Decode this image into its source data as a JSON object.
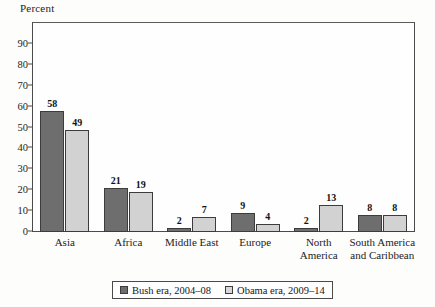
{
  "chart_data": {
    "type": "bar",
    "title": "",
    "ylabel": "Percent",
    "xlabel": "",
    "ylim": [
      0,
      100
    ],
    "yticks": [
      0,
      10,
      20,
      30,
      40,
      50,
      60,
      70,
      80,
      90
    ],
    "grid": false,
    "legend_position": "bottom",
    "categories": [
      "Asia",
      "Africa",
      "Middle East",
      "Europe",
      "North America",
      "South America and Caribbean"
    ],
    "category_lines": [
      [
        "Asia"
      ],
      [
        "Africa"
      ],
      [
        "Middle East"
      ],
      [
        "Europe"
      ],
      [
        "North",
        "America"
      ],
      [
        "South America",
        "and Caribbean"
      ]
    ],
    "series": [
      {
        "name": "Bush era, 2004–08",
        "color": "#6e6e6e",
        "values": [
          58,
          21,
          2,
          9,
          2,
          8
        ]
      },
      {
        "name": "Obama era, 2009–14",
        "color": "#d2d2d2",
        "values": [
          49,
          19,
          7,
          4,
          13,
          8
        ]
      }
    ]
  },
  "legend": {
    "entries": [
      {
        "label": "Bush era, 2004–08",
        "swatch": "bush"
      },
      {
        "label": "Obama era, 2009–14",
        "swatch": "obama"
      }
    ]
  }
}
